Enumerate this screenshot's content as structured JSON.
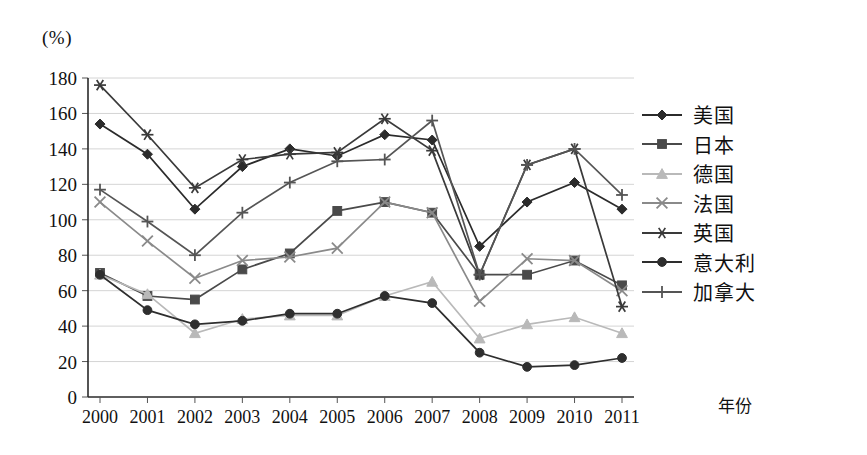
{
  "axis_unit_label": "(%)",
  "xaxis_title": "年份",
  "legend": {
    "items": [
      {
        "label": "美国",
        "marker": "diamond",
        "color": "#2b2b2b"
      },
      {
        "label": "日本",
        "marker": "square",
        "color": "#4a4a4a"
      },
      {
        "label": "德国",
        "marker": "triangle",
        "color": "#b9b9b9"
      },
      {
        "label": "法国",
        "marker": "x",
        "color": "#8a8a8a"
      },
      {
        "label": "英国",
        "marker": "asterisk",
        "color": "#3a3a3a"
      },
      {
        "label": "意大利",
        "marker": "circle",
        "color": "#2e2e2e"
      },
      {
        "label": "加拿大",
        "marker": "plus",
        "color": "#555555"
      }
    ]
  },
  "chart_data": {
    "type": "line",
    "title": "",
    "xlabel": "年份",
    "ylabel": "(%)",
    "ylim": [
      0,
      180
    ],
    "ytick_step": 20,
    "yticks": [
      0,
      20,
      40,
      60,
      80,
      100,
      120,
      140,
      160,
      180
    ],
    "grid": true,
    "legend_position": "right",
    "categories": [
      "2000",
      "2001",
      "2002",
      "2003",
      "2004",
      "2005",
      "2006",
      "2007",
      "2008",
      "2009",
      "2010",
      "2011"
    ],
    "series": [
      {
        "name": "美国",
        "marker": "diamond",
        "color": "#2b2b2b",
        "values": [
          154,
          137,
          106,
          130,
          140,
          136,
          148,
          145,
          85,
          110,
          121,
          106
        ]
      },
      {
        "name": "日本",
        "marker": "square",
        "color": "#4a4a4a",
        "values": [
          70,
          57,
          55,
          72,
          81,
          105,
          110,
          104,
          69,
          69,
          77,
          63
        ]
      },
      {
        "name": "德国",
        "marker": "triangle",
        "color": "#b9b9b9",
        "values": [
          69,
          58,
          36,
          44,
          46,
          46,
          57,
          65,
          33,
          41,
          45,
          36
        ]
      },
      {
        "name": "法国",
        "marker": "x",
        "color": "#8a8a8a",
        "values": [
          110,
          88,
          67,
          77,
          79,
          84,
          110,
          104,
          54,
          78,
          77,
          60
        ]
      },
      {
        "name": "英国",
        "marker": "asterisk",
        "color": "#3a3a3a",
        "values": [
          176,
          148,
          118,
          134,
          137,
          138,
          157,
          139,
          69,
          131,
          140,
          51
        ]
      },
      {
        "name": "意大利",
        "marker": "circle",
        "color": "#2e2e2e",
        "values": [
          69,
          49,
          41,
          43,
          47,
          47,
          57,
          53,
          25,
          17,
          18,
          22
        ]
      },
      {
        "name": "加拿大",
        "marker": "plus",
        "color": "#555555",
        "values": [
          117,
          99,
          80,
          104,
          121,
          133,
          134,
          156,
          69,
          131,
          140,
          114
        ]
      }
    ]
  }
}
